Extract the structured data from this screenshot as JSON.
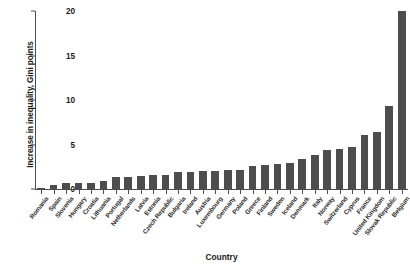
{
  "chart_data": {
    "type": "bar",
    "title": "",
    "subtitle": "",
    "xlabel": "Country",
    "ylabel": "Increase in inequality, Gini points",
    "ylim": [
      0,
      20
    ],
    "yticks": [
      0,
      5,
      10,
      15,
      20
    ],
    "ytick_labels": [
      "0",
      "5",
      "10",
      "15",
      "20"
    ],
    "grid": false,
    "legend": false,
    "bar_color": "#4d4d4d",
    "axis_color": "#4d4d4d",
    "background_color": "#ffffff",
    "categories": [
      "Romania",
      "Spain",
      "Slovenia",
      "Hungary",
      "Croatia",
      "Lithuania",
      "Portugal",
      "Netherlands",
      "Latvia",
      "Estonia",
      "Czech Republic",
      "Bulgaria",
      "Ireland",
      "Austria",
      "Luxembourg",
      "Germany",
      "Poland",
      "Greece",
      "Finland",
      "Sweden",
      "Iceland",
      "Denmark",
      "Italy",
      "Norway",
      "Switzerland",
      "Cyprus",
      "France",
      "United Kingdom",
      "Slovak Republic",
      "Belgium"
    ],
    "values": [
      0.1,
      0.4,
      0.7,
      0.7,
      0.7,
      0.9,
      1.3,
      1.4,
      1.5,
      1.6,
      1.6,
      1.9,
      1.9,
      2.0,
      2.0,
      2.1,
      2.1,
      2.6,
      2.7,
      2.8,
      2.9,
      3.4,
      3.8,
      4.4,
      4.5,
      4.7,
      6.1,
      6.4,
      9.3,
      20.0
    ]
  }
}
